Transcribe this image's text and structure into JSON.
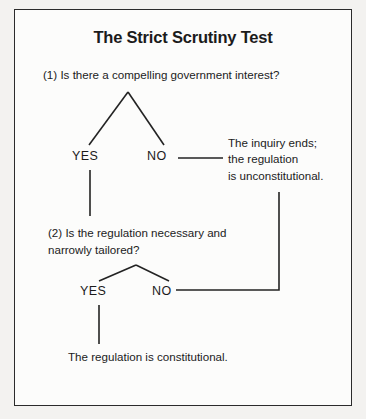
{
  "figure": {
    "title": "The Strict Scrutiny Test",
    "background_color": "#f3f2f0",
    "page_color": "#fcfcfb",
    "ink_color": "#1b1b1b",
    "border_color": "#2b2b2b"
  },
  "flowchart": {
    "type": "decision-tree",
    "questions": [
      {
        "id": "q1",
        "text": "(1) Is there a compelling government interest?"
      },
      {
        "id": "q2",
        "line1": "(2) Is the regulation necessary and",
        "line2": "narrowly tailored?"
      }
    ],
    "branch_labels": {
      "q1_yes": "YES",
      "q1_no": "NO",
      "q2_yes": "YES",
      "q2_no": "NO"
    },
    "outcomes": [
      {
        "id": "unconstitutional",
        "line1": "The inquiry ends;",
        "line2": "the regulation",
        "line3": "is unconstitutional."
      },
      {
        "id": "constitutional",
        "text": "The regulation is constitutional."
      }
    ]
  }
}
